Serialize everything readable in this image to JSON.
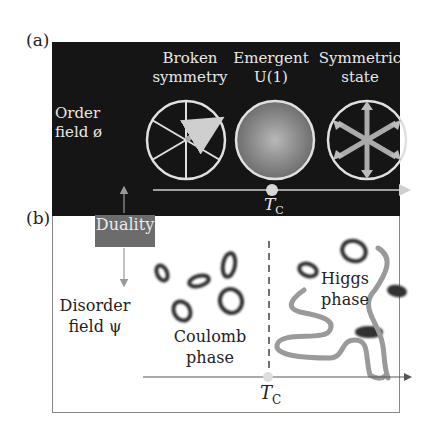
{
  "figure": {
    "panel_a": {
      "label": "(a)",
      "axis_label_line1": "Order",
      "axis_label_line2": "field ø",
      "states": [
        {
          "line1": "Broken",
          "line2": "symmetry",
          "icon": "circle-six-spokes-single-arrow"
        },
        {
          "line1": "Emergent",
          "line2": "U(1)",
          "icon": "circle-radial-gradient"
        },
        {
          "line1": "Symmetric",
          "line2": "state",
          "icon": "circle-six-double-arrows"
        }
      ],
      "critical_point": "T",
      "critical_sub": "C"
    },
    "duality_label": "Duality",
    "panel_b": {
      "label": "(b)",
      "axis_label_line1": "Disorder",
      "axis_label_line2": "field ψ",
      "left_phase_line1": "Coulomb",
      "left_phase_line2": "phase",
      "right_phase_line1": "Higgs",
      "right_phase_line2": "phase",
      "critical_point": "T",
      "critical_sub": "C"
    }
  }
}
